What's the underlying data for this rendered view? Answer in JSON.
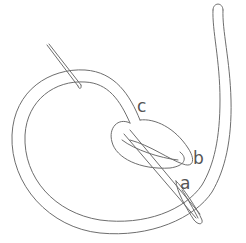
{
  "diagram": {
    "labels": [
      {
        "id": "a",
        "text": "a"
      },
      {
        "id": "b",
        "text": "b"
      },
      {
        "id": "c",
        "text": "c"
      }
    ],
    "colors": {
      "line": "#6e6e6e",
      "label": "#555555",
      "background": "#ffffff"
    }
  }
}
